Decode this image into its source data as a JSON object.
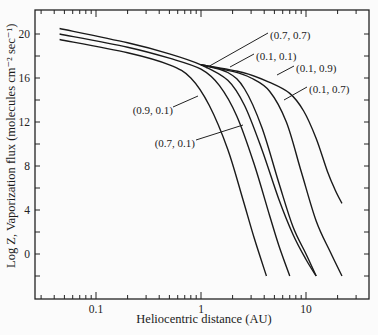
{
  "chart_data": {
    "type": "line",
    "title": "",
    "xlabel": "Heliocentric distance (AU)",
    "ylabel": "Log Z, Vaporization flux (molecules cm⁻² sec⁻¹)",
    "x_scale": "log",
    "xlim": [
      0.035,
      35
    ],
    "ylim": [
      -4,
      22
    ],
    "x_ticks": [
      0.1,
      1,
      10
    ],
    "x_tick_labels": [
      "0.1",
      "1",
      "10"
    ],
    "y_ticks": [
      0,
      4,
      8,
      12,
      16,
      20
    ],
    "y_tick_labels": [
      "0",
      "4",
      "8",
      "12",
      "16",
      "20"
    ],
    "grid": false,
    "legend": "inline labels with leader lines",
    "series": [
      {
        "name": "(0.9, 0.1)",
        "x": [
          0.045,
          0.2,
          0.5,
          0.8,
          1.2,
          1.8,
          2.5,
          3.2,
          4.2
        ],
        "values": [
          19.5,
          18.3,
          17.2,
          16.0,
          13.5,
          9.5,
          5.0,
          1.5,
          -2.0
        ]
      },
      {
        "name": "(0.7, 0.1)",
        "x": [
          0.045,
          0.2,
          0.5,
          1.0,
          1.5,
          2.2,
          3.2,
          4.5,
          5.5,
          7.0
        ],
        "values": [
          20.0,
          18.8,
          17.8,
          16.8,
          15.3,
          12.5,
          8.2,
          3.5,
          0.8,
          -2.0
        ]
      },
      {
        "name": "(0.7, 0.7)",
        "x": [
          0.045,
          0.2,
          0.5,
          1.0,
          1.8,
          2.6,
          3.8,
          5.5,
          7.5,
          10.0,
          12.5
        ],
        "values": [
          20.5,
          19.2,
          18.2,
          17.2,
          15.8,
          13.5,
          9.5,
          5.0,
          1.8,
          -0.5,
          -2.0
        ]
      },
      {
        "name": "(0.1, 0.1)",
        "x": [
          1.0,
          1.8,
          2.6,
          3.8,
          5.5,
          7.5,
          10.0,
          12.5
        ],
        "values": [
          17.2,
          16.5,
          15.0,
          11.5,
          6.5,
          2.5,
          0.0,
          -2.0
        ]
      },
      {
        "name": "(0.1, 0.9)",
        "x": [
          1.0,
          2.0,
          3.0,
          4.5,
          6.5,
          9.0,
          12.5,
          17.0,
          22.0
        ],
        "values": [
          17.2,
          16.6,
          16.0,
          14.8,
          12.0,
          7.5,
          3.0,
          0.2,
          -2.0
        ]
      },
      {
        "name": "(0.1, 0.7)",
        "x": [
          1.0,
          2.5,
          4.5,
          7.0,
          9.5,
          12.5,
          16.0,
          19.0,
          22.0
        ],
        "values": [
          17.2,
          16.5,
          15.6,
          14.6,
          13.0,
          10.5,
          7.5,
          5.8,
          4.6
        ]
      }
    ],
    "annotations": [
      {
        "text": "(0.7, 0.7)",
        "x_px": 270,
        "y_px": 35
      },
      {
        "text": "(0.1, 0.1)",
        "x_px": 256,
        "y_px": 56
      },
      {
        "text": "(0.1, 0.9)",
        "x_px": 296,
        "y_px": 68
      },
      {
        "text": "(0.1, 0.7)",
        "x_px": 309,
        "y_px": 89
      },
      {
        "text": "(0.9, 0.1)",
        "x_px": 133,
        "y_px": 110
      },
      {
        "text": "(0.7, 0.1)",
        "x_px": 155,
        "y_px": 143
      }
    ]
  },
  "axes": {
    "xlabel": "Heliocentric distance (AU)",
    "ylabel": "Log Z, Vaporization flux (molecules cm⁻² sec⁻¹)"
  }
}
